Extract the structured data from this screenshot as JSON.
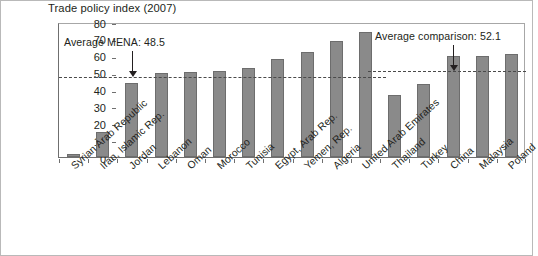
{
  "chart_data": {
    "type": "bar",
    "title": "Trade policy index (2007)",
    "xlabel": "",
    "ylabel": "",
    "ylim": [
      0,
      80
    ],
    "yticks": [
      0,
      10,
      20,
      30,
      40,
      50,
      60,
      70,
      80
    ],
    "grid": false,
    "legend": "none",
    "bar_color": "#8a8a8a",
    "categories": [
      "Syrian Arab Republic",
      "Iran, Islamic Rep.",
      "Jordan",
      "Lebanon",
      "Oman",
      "Morocco",
      "Tunisia",
      "Egypt, Arab Rep.",
      "Yemen, Rep.",
      "Algeria",
      "United Arab Emirates",
      "Thailand",
      "Turkey",
      "China",
      "Malaysia",
      "Poland"
    ],
    "values": [
      2,
      15,
      44,
      50,
      50.5,
      51,
      53,
      58,
      62,
      69,
      74,
      37,
      43,
      60,
      60,
      61
    ],
    "reference_lines": [
      {
        "label": "Average MENA: 48.5",
        "value": 48.5,
        "span": "mena",
        "annotation_x_pct": 19,
        "arrow_target_index": 2
      },
      {
        "label": "Average comparison: 52.1",
        "value": 52.1,
        "span": "comparison",
        "annotation_x_pct": 74,
        "arrow_target_index": 13
      }
    ]
  }
}
